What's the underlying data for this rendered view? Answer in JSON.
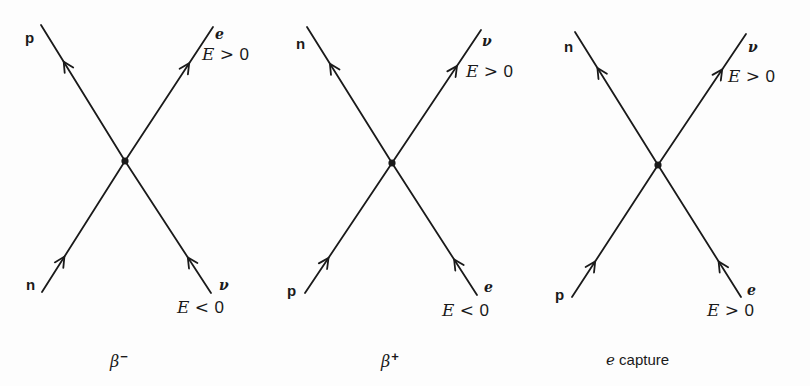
{
  "figure": {
    "line_color": "#1a1a1a",
    "background": "#fdfdfd"
  },
  "diagrams": [
    {
      "id": "beta-minus",
      "caption_base": "β",
      "caption_sup": "−",
      "center": [
        125,
        161
      ],
      "legs": [
        {
          "position": "top-left",
          "particle": "p",
          "style": "roman",
          "end": [
            41,
            25
          ],
          "arrow": "outgoing",
          "energy": ""
        },
        {
          "position": "top-right",
          "particle": "e",
          "style": "italic",
          "end": [
            213,
            27
          ],
          "arrow": "outgoing",
          "energy": "E > 0"
        },
        {
          "position": "bottom-left",
          "particle": "n",
          "style": "roman",
          "end": [
            42,
            292
          ],
          "arrow": "incoming",
          "energy": ""
        },
        {
          "position": "bottom-right",
          "particle": "ν",
          "style": "italic",
          "end": [
            211,
            293
          ],
          "arrow": "incoming",
          "energy": "E < 0"
        }
      ]
    },
    {
      "id": "beta-plus",
      "caption_base": "β",
      "caption_sup": "+",
      "center": [
        392,
        163
      ],
      "legs": [
        {
          "position": "top-left",
          "particle": "n",
          "style": "roman",
          "end": [
            307,
            27
          ],
          "arrow": "outgoing",
          "energy": ""
        },
        {
          "position": "top-right",
          "particle": "ν",
          "style": "italic",
          "end": [
            481,
            30
          ],
          "arrow": "outgoing",
          "energy": "E > 0"
        },
        {
          "position": "bottom-left",
          "particle": "p",
          "style": "roman",
          "end": [
            305,
            293
          ],
          "arrow": "incoming",
          "energy": ""
        },
        {
          "position": "bottom-right",
          "particle": "e",
          "style": "italic",
          "end": [
            477,
            295
          ],
          "arrow": "incoming",
          "energy": "E < 0"
        }
      ]
    },
    {
      "id": "electron-capture",
      "caption_italic": "e",
      "caption_text": " capture",
      "center": [
        658,
        165
      ],
      "legs": [
        {
          "position": "top-left",
          "particle": "n",
          "style": "roman",
          "end": [
            575,
            32
          ],
          "arrow": "outgoing",
          "energy": ""
        },
        {
          "position": "top-right",
          "particle": "ν",
          "style": "italic",
          "end": [
            746,
            34
          ],
          "arrow": "outgoing",
          "energy": "E > 0"
        },
        {
          "position": "bottom-left",
          "particle": "p",
          "style": "roman",
          "end": [
            572,
            297
          ],
          "arrow": "incoming",
          "energy": ""
        },
        {
          "position": "bottom-right",
          "particle": "e",
          "style": "italic",
          "end": [
            741,
            297
          ],
          "arrow": "incoming",
          "energy": "E > 0"
        }
      ]
    }
  ],
  "labels": {
    "d1": {
      "p": "p",
      "e": "e",
      "n": "n",
      "nu": "ν",
      "energy_top": {
        "E": "E",
        "op": ">",
        "zero": "0"
      },
      "energy_bottom": {
        "E": "E",
        "op": "<",
        "zero": "0"
      },
      "caption_base": "β",
      "caption_sup": "−"
    },
    "d2": {
      "n": "n",
      "nu": "ν",
      "p": "p",
      "e": "e",
      "energy_top": {
        "E": "E",
        "op": ">",
        "zero": "0"
      },
      "energy_bottom": {
        "E": "E",
        "op": "<",
        "zero": "0"
      },
      "caption_base": "β",
      "caption_sup": "+"
    },
    "d3": {
      "n": "n",
      "nu": "ν",
      "p": "p",
      "e": "e",
      "energy_top": {
        "E": "E",
        "op": ">",
        "zero": "0"
      },
      "energy_bottom": {
        "E": "E",
        "op": ">",
        "zero": "0"
      },
      "caption_italic": "e",
      "caption_text": " capture"
    }
  }
}
